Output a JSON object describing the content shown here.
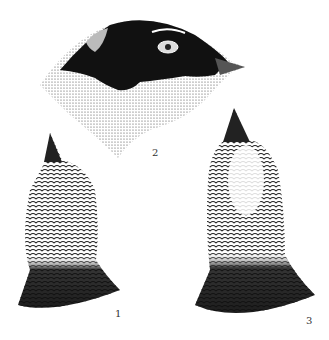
{
  "figure": {
    "labels": [
      {
        "id": "1",
        "text": "1"
      },
      {
        "id": "2",
        "text": "2"
      },
      {
        "id": "3",
        "text": "3"
      }
    ],
    "colors": {
      "ink": "#111111",
      "paper": "#ffffff",
      "stipple": "#555555"
    }
  }
}
